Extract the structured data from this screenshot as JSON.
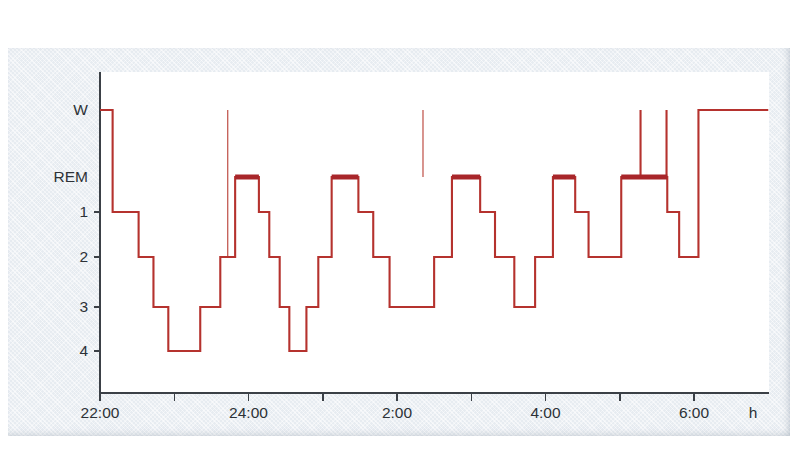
{
  "figure": {
    "background_color": "#e7ecf1",
    "plot_background_color": "#ffffff",
    "trace_color": "#b5322e",
    "axis_color": "#3b4046"
  },
  "axis": {
    "y_labels": [
      "W",
      "REM",
      "1",
      "2",
      "3",
      "4"
    ],
    "x_labels": [
      "22:00",
      "24:00",
      "2:00",
      "4:00",
      "6:00"
    ],
    "x_unit": "h"
  },
  "chart_data": {
    "type": "line",
    "title": "",
    "xlabel": "h",
    "ylabel": "",
    "grid": false,
    "legend": "none",
    "xlim": [
      22.0,
      7.0
    ],
    "x_tick_values": [
      22,
      23,
      24,
      25,
      26,
      27,
      28,
      29,
      30
    ],
    "x_tick_labels": [
      "22:00",
      "",
      "24:00",
      "",
      "2:00",
      "",
      "4:00",
      "",
      "6:00"
    ],
    "y_categories": [
      "W",
      "REM",
      "1",
      "2",
      "3",
      "4"
    ],
    "y_category_values": [
      0,
      1,
      2,
      3,
      4,
      5
    ],
    "segments": [
      {
        "start": 22.0,
        "end": 22.17,
        "stage": "W"
      },
      {
        "start": 22.17,
        "end": 22.52,
        "stage": "1"
      },
      {
        "start": 22.52,
        "end": 22.72,
        "stage": "2"
      },
      {
        "start": 22.72,
        "end": 22.92,
        "stage": "3"
      },
      {
        "start": 22.92,
        "end": 23.35,
        "stage": "4"
      },
      {
        "start": 23.35,
        "end": 23.62,
        "stage": "3"
      },
      {
        "start": 23.62,
        "end": 23.82,
        "stage": "2"
      },
      {
        "start": 23.82,
        "end": 24.14,
        "stage": "REM"
      },
      {
        "start": 24.14,
        "end": 24.28,
        "stage": "1"
      },
      {
        "start": 24.28,
        "end": 24.42,
        "stage": "2"
      },
      {
        "start": 24.42,
        "end": 24.55,
        "stage": "3"
      },
      {
        "start": 24.55,
        "end": 24.78,
        "stage": "4"
      },
      {
        "start": 24.78,
        "end": 24.94,
        "stage": "3"
      },
      {
        "start": 24.94,
        "end": 25.12,
        "stage": "2"
      },
      {
        "start": 25.12,
        "end": 25.48,
        "stage": "REM"
      },
      {
        "start": 25.48,
        "end": 25.68,
        "stage": "1"
      },
      {
        "start": 25.68,
        "end": 25.9,
        "stage": "2"
      },
      {
        "start": 25.9,
        "end": 26.5,
        "stage": "3"
      },
      {
        "start": 26.5,
        "end": 26.74,
        "stage": "2"
      },
      {
        "start": 26.74,
        "end": 27.12,
        "stage": "REM"
      },
      {
        "start": 27.12,
        "end": 27.32,
        "stage": "1"
      },
      {
        "start": 27.32,
        "end": 27.58,
        "stage": "2"
      },
      {
        "start": 27.58,
        "end": 27.86,
        "stage": "3"
      },
      {
        "start": 27.86,
        "end": 28.1,
        "stage": "2"
      },
      {
        "start": 28.1,
        "end": 28.4,
        "stage": "REM"
      },
      {
        "start": 28.4,
        "end": 28.58,
        "stage": "1"
      },
      {
        "start": 28.58,
        "end": 29.02,
        "stage": "2"
      },
      {
        "start": 29.02,
        "end": 29.64,
        "stage": "REM"
      },
      {
        "start": 29.64,
        "end": 29.8,
        "stage": "1"
      },
      {
        "start": 29.8,
        "end": 30.06,
        "stage": "2"
      },
      {
        "start": 30.06,
        "end": 31.0,
        "stage": "W"
      }
    ],
    "wake_spikes": [
      {
        "time": 23.72,
        "from_stage": "2",
        "to_stage": "W",
        "style": "thin"
      },
      {
        "time": 26.35,
        "from_stage": "REM",
        "to_stage": "W",
        "style": "thin"
      },
      {
        "time": 29.28,
        "from_stage": "REM",
        "to_stage": "W",
        "style": "strong"
      },
      {
        "time": 29.63,
        "from_stage": "REM",
        "to_stage": "W",
        "style": "strong"
      }
    ]
  }
}
